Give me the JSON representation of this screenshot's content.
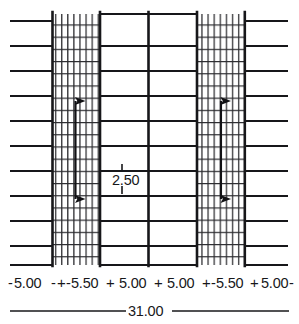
{
  "drawing": {
    "title": "Slab plan with dimension annotations",
    "line_color": "#17171a",
    "hatch_color": "#2a2a2e",
    "background": "#ffffff",
    "units_note": "",
    "interior_label": {
      "value": "2.50",
      "name": "interior-dimension-2-50"
    },
    "overall_dimension": {
      "value": "31.00",
      "name": "overall-dimension-31-00"
    },
    "dimension_chain": [
      {
        "value": "5.00",
        "kind": "margin"
      },
      {
        "value": "5.50",
        "kind": "hatched"
      },
      {
        "value": "5.00",
        "kind": "bay"
      },
      {
        "value": "5.00",
        "kind": "bay"
      },
      {
        "value": "5.50",
        "kind": "hatched"
      },
      {
        "value": "5.00",
        "kind": "margin"
      }
    ],
    "dimension_chain_text": "-5.00-+-5.50-+-5.00-+-5.00-+-5.50-+-5.00-",
    "tick_symbol": "+",
    "end_dash": "-",
    "arrows": [
      {
        "name": "left-span-arrow",
        "direction": "double-vertical"
      },
      {
        "name": "right-span-arrow",
        "direction": "double-vertical"
      }
    ],
    "columns": [
      {
        "name": "left-margin-region",
        "x": 10,
        "width": 42,
        "hatched": false
      },
      {
        "name": "left-hatched-band",
        "x": 52,
        "width": 48,
        "hatched": true
      },
      {
        "name": "center-bay-left",
        "x": 100,
        "width": 48,
        "hatched": false
      },
      {
        "name": "center-bay-right",
        "x": 148,
        "width": 49,
        "hatched": false
      },
      {
        "name": "right-hatched-band",
        "x": 197,
        "width": 48,
        "hatched": true
      },
      {
        "name": "right-margin-region",
        "x": 245,
        "width": 43,
        "hatched": false
      }
    ]
  }
}
